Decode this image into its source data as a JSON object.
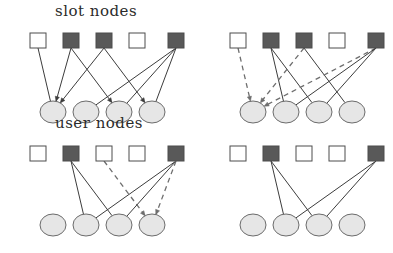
{
  "figure": {
    "title_slot": "slot nodes",
    "title_user": "user nodes",
    "colors": {
      "dark_square_fill": "#595959",
      "light_square_fill": "#ffffff",
      "square_stroke": "#4d4d4d",
      "circle_fill": "#e6e6e6",
      "circle_stroke": "#6b6b6b",
      "edge_solid": "#3c3c3c",
      "edge_dashed": "#6e6e6e",
      "background": "#ffffff",
      "text": "#2b2b2b"
    },
    "geometry": {
      "square_w": 16,
      "square_h": 15,
      "circle_rx": 13,
      "circle_ry": 11,
      "slot_x": [
        30,
        63,
        96,
        129,
        168
      ],
      "user_x": [
        40,
        73,
        106,
        139
      ],
      "panel_offset_x": 200,
      "panel_offset_y": 113,
      "slot_y": 33,
      "user_y": 101
    },
    "panels": [
      {
        "id": "top-left",
        "name": "panel-top-left",
        "slots": [
          "light",
          "dark",
          "dark",
          "light",
          "dark"
        ],
        "users": [
          "plain",
          "plain",
          "plain",
          "plain"
        ],
        "edges": [
          {
            "slot": 1,
            "user": 1,
            "style": "solid",
            "arrow": false
          },
          {
            "slot": 2,
            "user": 1,
            "style": "solid",
            "arrow": true
          },
          {
            "slot": 2,
            "user": 3,
            "style": "solid",
            "arrow": true
          },
          {
            "slot": 3,
            "user": 1,
            "style": "solid",
            "arrow": true
          },
          {
            "slot": 3,
            "user": 4,
            "style": "solid",
            "arrow": true
          },
          {
            "slot": 5,
            "user": 2,
            "style": "solid",
            "arrow": false
          },
          {
            "slot": 5,
            "user": 3,
            "style": "solid",
            "arrow": false
          },
          {
            "slot": 5,
            "user": 4,
            "style": "solid",
            "arrow": false
          }
        ]
      },
      {
        "id": "top-right",
        "name": "panel-top-right",
        "slots": [
          "light",
          "dark",
          "dark",
          "light",
          "dark"
        ],
        "users": [
          "plain",
          "plain",
          "plain",
          "plain"
        ],
        "edges": [
          {
            "slot": 1,
            "user": 1,
            "style": "dashed",
            "arrow": true
          },
          {
            "slot": 2,
            "user": 2,
            "style": "solid",
            "arrow": false
          },
          {
            "slot": 2,
            "user": 3,
            "style": "solid",
            "arrow": false
          },
          {
            "slot": 3,
            "user": 1,
            "style": "dashed",
            "arrow": true
          },
          {
            "slot": 3,
            "user": 4,
            "style": "solid",
            "arrow": false
          },
          {
            "slot": 5,
            "user": 1,
            "style": "dashed",
            "arrow": true
          },
          {
            "slot": 5,
            "user": 2,
            "style": "solid",
            "arrow": false
          },
          {
            "slot": 5,
            "user": 3,
            "style": "solid",
            "arrow": false
          }
        ]
      },
      {
        "id": "bottom-left",
        "name": "panel-bottom-left",
        "slots": [
          "light",
          "dark",
          "light",
          "light",
          "dark"
        ],
        "users": [
          "plain",
          "plain",
          "plain",
          "plain"
        ],
        "edges": [
          {
            "slot": 2,
            "user": 2,
            "style": "solid",
            "arrow": false
          },
          {
            "slot": 2,
            "user": 3,
            "style": "solid",
            "arrow": false
          },
          {
            "slot": 3,
            "user": 4,
            "style": "dashed",
            "arrow": true
          },
          {
            "slot": 5,
            "user": 2,
            "style": "solid",
            "arrow": false
          },
          {
            "slot": 5,
            "user": 3,
            "style": "solid",
            "arrow": false
          },
          {
            "slot": 5,
            "user": 4,
            "style": "dashed",
            "arrow": true
          }
        ]
      },
      {
        "id": "bottom-right",
        "name": "panel-bottom-right",
        "slots": [
          "light",
          "dark",
          "light",
          "light",
          "dark"
        ],
        "users": [
          "plain",
          "plain",
          "plain",
          "plain"
        ],
        "edges": [
          {
            "slot": 2,
            "user": 2,
            "style": "solid",
            "arrow": false
          },
          {
            "slot": 2,
            "user": 3,
            "style": "solid",
            "arrow": false
          },
          {
            "slot": 5,
            "user": 2,
            "style": "solid",
            "arrow": false
          },
          {
            "slot": 5,
            "user": 3,
            "style": "solid",
            "arrow": false
          }
        ]
      }
    ]
  }
}
